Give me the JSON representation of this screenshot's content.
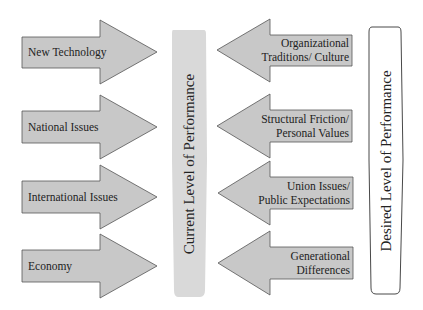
{
  "diagram": {
    "colors": {
      "arrow_fill": "#c8c8c8",
      "arrow_stroke": "#555555",
      "current_pillar_fill": "#d9d9d9",
      "desired_pillar_fill": "#ffffff",
      "desired_pillar_stroke": "#333333",
      "text": "#222222"
    },
    "driving_forces": [
      {
        "label": "New Technology"
      },
      {
        "label": "National Issues"
      },
      {
        "label": "International Issues"
      },
      {
        "label": "Economy"
      }
    ],
    "restraining_forces": [
      {
        "line1": "Organizational",
        "line2": "Traditions/ Culture"
      },
      {
        "line1": "Structural Friction/",
        "line2": "Personal Values"
      },
      {
        "line1": "Union Issues/",
        "line2": "Public Expectations"
      },
      {
        "line1": "Generational",
        "line2": "Differences"
      }
    ],
    "current_level": {
      "label": "Current Level of Performance"
    },
    "desired_level": {
      "label": "Desired Level of Performance"
    }
  }
}
